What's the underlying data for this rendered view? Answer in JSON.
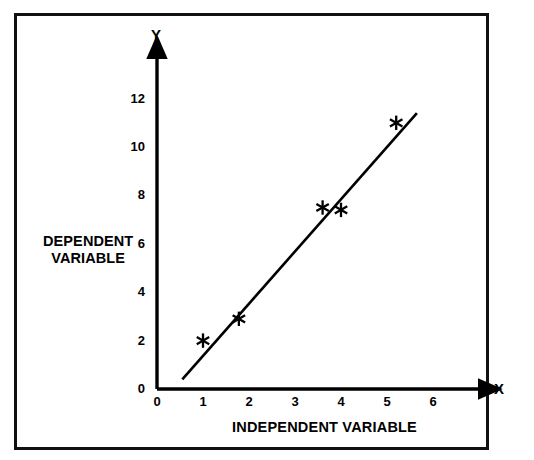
{
  "figure": {
    "background_color": "#ffffff",
    "ink_color": "#000000",
    "frame": {
      "border_color": "#111111"
    }
  },
  "axes": {
    "x": {
      "name": "X",
      "title": "INDEPENDENT VARIABLE",
      "ticks": [
        "0",
        "1",
        "2",
        "3",
        "4",
        "5",
        "6"
      ]
    },
    "y": {
      "name": "Y",
      "title_line1": "DEPENDENT",
      "title_line2": "VARIABLE",
      "ticks": [
        "0",
        "2",
        "4",
        "6",
        "8",
        "10",
        "12"
      ]
    }
  },
  "chart_data": {
    "type": "scatter",
    "title": "",
    "subtitle": "",
    "xlabel": "INDEPENDENT VARIABLE",
    "ylabel": "DEPENDENT VARIABLE",
    "xlim": [
      0,
      6
    ],
    "ylim": [
      0,
      12
    ],
    "xticks": [
      0,
      1,
      2,
      3,
      4,
      5,
      6
    ],
    "yticks": [
      0,
      2,
      4,
      6,
      8,
      10,
      12
    ],
    "grid": false,
    "legend": "none",
    "axis_style": "arrow-tipped",
    "marker": "asterisk",
    "marker_color": "#000000",
    "series": [
      {
        "name": "observations",
        "points": [
          {
            "x": 1.0,
            "y": 2.0
          },
          {
            "x": 1.78,
            "y": 2.9
          },
          {
            "x": 3.6,
            "y": 7.5
          },
          {
            "x": 4.0,
            "y": 7.4
          },
          {
            "x": 5.2,
            "y": 11.0
          }
        ]
      }
    ],
    "fit_line": {
      "name": "regression line",
      "x_start": 0.55,
      "y_start": 0.4,
      "x_end": 5.65,
      "y_end": 11.4,
      "color": "#000000"
    }
  }
}
